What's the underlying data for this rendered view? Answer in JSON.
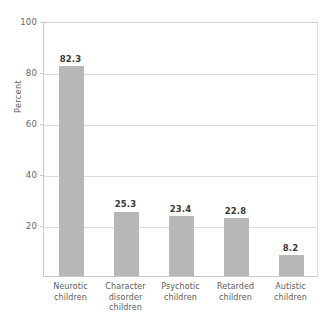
{
  "caption": {
    "clipped_text": ""
  },
  "chart_data": {
    "type": "bar",
    "title": "",
    "xlabel": "",
    "ylabel": "Percent",
    "ylim": [
      0,
      100
    ],
    "yticks": [
      20,
      40,
      60,
      80,
      100
    ],
    "ytick_labels": [
      "20",
      "40",
      "60",
      "80",
      "100"
    ],
    "grid": true,
    "legend": "none",
    "bar_color": "#b7b7b7",
    "categories": [
      "Neurotic children",
      "Character disorder children",
      "Psychotic children",
      "Retarded children",
      "Autistic children"
    ],
    "category_lines": [
      [
        "Neurotic",
        "children"
      ],
      [
        "Character",
        "disorder",
        "children"
      ],
      [
        "Psychotic",
        "children"
      ],
      [
        "Retarded",
        "children"
      ],
      [
        "Autistic",
        "children"
      ]
    ],
    "values": [
      82.3,
      25.3,
      23.4,
      22.8,
      8.2
    ],
    "value_labels": [
      "82.3",
      "25.3",
      "23.4",
      "22.8",
      "8.2"
    ]
  }
}
